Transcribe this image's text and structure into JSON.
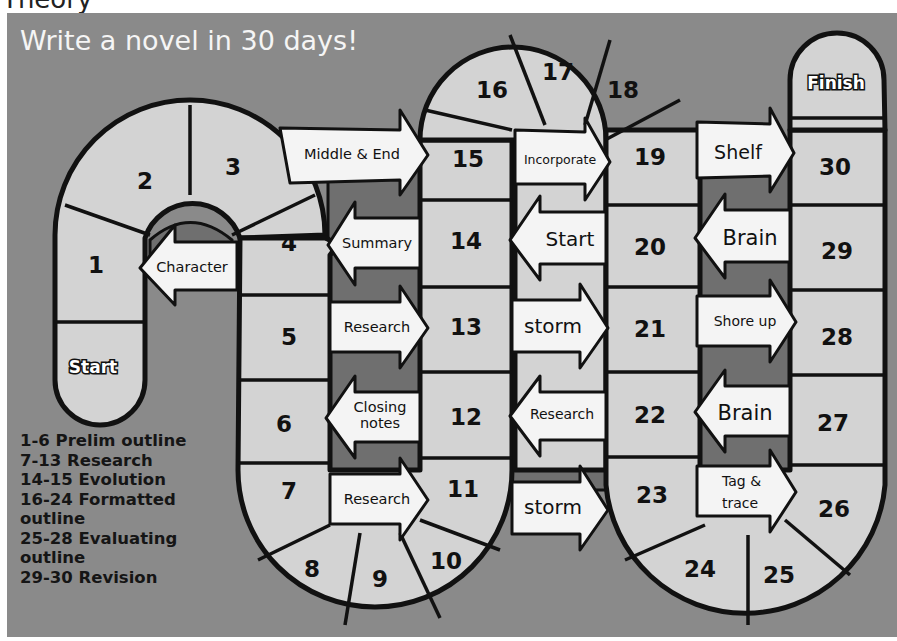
{
  "page_title": "Theory",
  "board": {
    "headline": "Write a novel in 30 days!",
    "start_label": "Start",
    "finish_label": "Finish",
    "colors": {
      "background": "#8a8a8a",
      "tile": "#d3d3d3",
      "arrow": "#f4f4f4",
      "channel": "#6f6f6f",
      "outline": "#111111"
    },
    "tiles": [
      "1",
      "2",
      "3",
      "4",
      "5",
      "6",
      "7",
      "8",
      "9",
      "10",
      "11",
      "12",
      "13",
      "14",
      "15",
      "16",
      "17",
      "18",
      "19",
      "20",
      "21",
      "22",
      "23",
      "24",
      "25",
      "26",
      "27",
      "28",
      "29",
      "30"
    ],
    "arrows": [
      {
        "label": "Character",
        "direction": "left"
      },
      {
        "label": "Middle & End",
        "direction": "right"
      },
      {
        "label": "Summary",
        "direction": "left"
      },
      {
        "label": "Research",
        "direction": "right"
      },
      {
        "label_line1": "Closing",
        "label_line2": "notes",
        "direction": "left"
      },
      {
        "label": "Research",
        "direction": "right"
      },
      {
        "label": "Incorporate",
        "direction": "right"
      },
      {
        "label": "Start",
        "direction": "left"
      },
      {
        "label": "storm",
        "direction": "right"
      },
      {
        "label": "Research",
        "direction": "left"
      },
      {
        "label": "storm",
        "direction": "right"
      },
      {
        "label": "Shelf",
        "direction": "right"
      },
      {
        "label": "Brain",
        "direction": "left"
      },
      {
        "label": "Shore up",
        "direction": "right"
      },
      {
        "label": "Brain",
        "direction": "left"
      },
      {
        "label_line1": "Tag &",
        "label_line2": "trace",
        "direction": "right"
      }
    ]
  },
  "legend": [
    "1-6 Prelim outline",
    "7-13 Research",
    "14-15 Evolution",
    "16-24 Formatted",
    "outline",
    "25-28 Evaluating",
    "outline",
    "29-30 Revision"
  ]
}
